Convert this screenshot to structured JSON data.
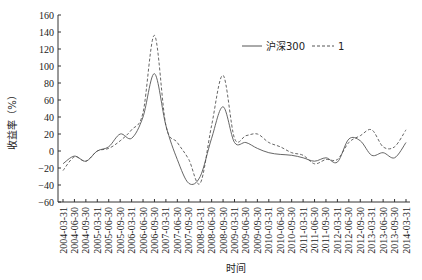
{
  "chart_data": {
    "type": "line",
    "title": "",
    "xlabel": "时间",
    "ylabel": "收益率（%）",
    "ylim": [
      -60,
      160
    ],
    "yticks": [
      -60,
      -40,
      -20,
      0,
      20,
      40,
      60,
      80,
      100,
      120,
      140,
      160
    ],
    "grid": false,
    "legend_position": "top-right",
    "categories": [
      "2004-03-31",
      "2004-06-30",
      "2004-09-30",
      "2005-03-31",
      "2005-06-30",
      "2005-09-30",
      "2006-03-31",
      "2006-06-30",
      "2006-09-30",
      "2007-03-31",
      "2007-06-30",
      "2007-09-30",
      "2008-03-31",
      "2008-06-30",
      "2008-09-30",
      "2009-03-31",
      "2009-06-30",
      "2009-09-30",
      "2010-03-31",
      "2010-06-30",
      "2010-09-30",
      "2011-03-31",
      "2011-06-30",
      "2011-09-30",
      "2012-03-31",
      "2012-06-30",
      "2012-09-30",
      "2013-03-31",
      "2013-06-30",
      "2013-09-30",
      "2014-03-31"
    ],
    "series": [
      {
        "name": "沪深300",
        "style": "solid",
        "color": "#555555",
        "values": [
          -15,
          -6,
          -12,
          0,
          5,
          20,
          15,
          40,
          91,
          30,
          -10,
          -38,
          -30,
          15,
          52,
          10,
          10,
          3,
          -2,
          -4,
          -5,
          -8,
          -12,
          -8,
          -13,
          14,
          12,
          -5,
          -2,
          -8,
          10
        ]
      },
      {
        "name": "1",
        "style": "dashed",
        "color": "#555555",
        "values": [
          -23,
          -7,
          -12,
          0,
          3,
          12,
          25,
          45,
          136,
          30,
          10,
          -10,
          -38,
          30,
          89,
          15,
          18,
          20,
          10,
          5,
          -2,
          -5,
          -15,
          -10,
          -10,
          10,
          18,
          25,
          5,
          5,
          25
        ]
      }
    ]
  },
  "legend": {
    "items": [
      {
        "label": "沪深300",
        "style": "solid"
      },
      {
        "label": "1",
        "style": "dashed"
      }
    ]
  },
  "axes": {
    "x_title": "时间",
    "y_title": "收益率（%）"
  }
}
